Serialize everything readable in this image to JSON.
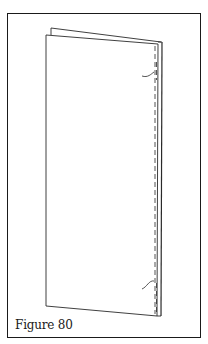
{
  "figure": {
    "caption": "Figure 80"
  }
}
